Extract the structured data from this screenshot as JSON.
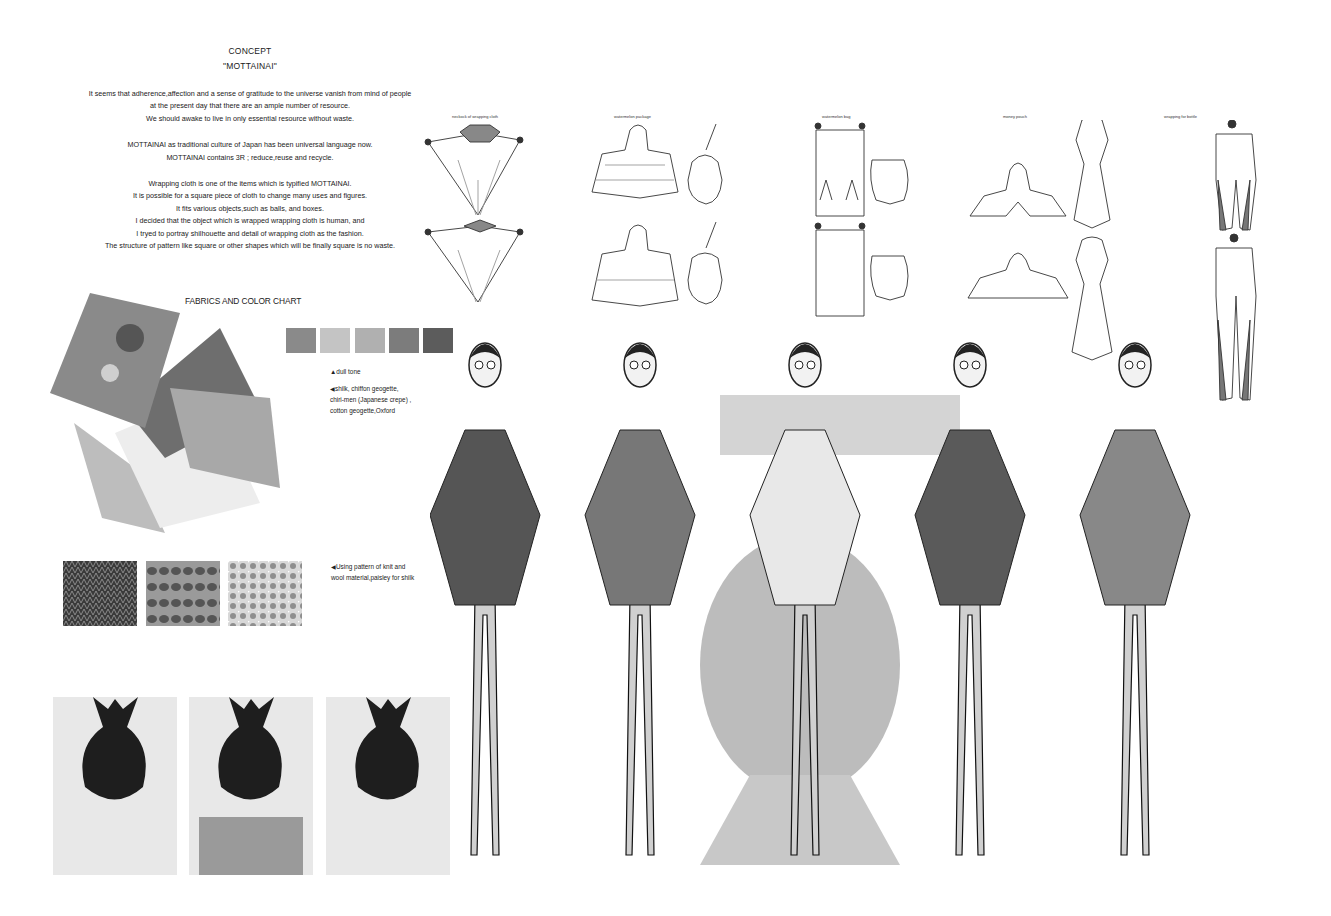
{
  "concept": {
    "heading": "CONCEPT",
    "subheading": "\"MOTTAINAI\"",
    "paragraphs": [
      [
        "It seems that adherence,affection and a sense of gratitude to the universe vanish from mind of people",
        "at the present day that there are an ample number of resource.",
        "We should awake to live in only essential resource without waste."
      ],
      [
        "MOTTAINAI as traditional culture of Japan has been universal language now.",
        "MOTTAINAI contains 3R ; reduce,reuse and recycle."
      ],
      [
        "Wrapping cloth is one of the items which is typified MOTTAINAI.",
        "It is possible for a square piece of cloth to change many uses and figures.",
        "It fits various objects,such as balls, and boxes.",
        "I decided that the object which is wrapped wrapping cloth is human, and",
        "I tryed to portray shilhouette and detail of wrapping cloth as the fashion.",
        "The structure of pattern like square or other shapes which will be finally square is no waste."
      ]
    ]
  },
  "flats": {
    "labels": [
      "neckock of wrapping cloth",
      "watermelon package",
      "watermelon bag",
      "money pouch",
      "wrapping for bottle"
    ]
  },
  "fabrics": {
    "title": "FABRICS AND COLOR CHART",
    "color_chart": [
      "#8a8a8a",
      "#c4c4c4",
      "#b0b0b0",
      "#7c7c7c",
      "#5c5c5c"
    ],
    "tone_note": "▲dull tone",
    "material_note": [
      "◀shilk, chiffon geogette,",
      "chiri-men (Japanese crepe) ,",
      "cotton geogette,Oxford"
    ],
    "pattern_note": [
      "◀Using pattern of knit and",
      "wool material,paisley for shilk"
    ],
    "patterns": [
      "knit",
      "wool-wave",
      "paisley"
    ]
  },
  "photos": {
    "count": 3
  },
  "figures": {
    "count": 5
  }
}
